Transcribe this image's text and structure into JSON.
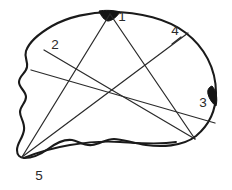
{
  "figure": {
    "type": "line-drawing",
    "background_color": "#ffffff",
    "outline_color": "#1a1a1a",
    "chord_color": "#2b2b2b",
    "label_color": "#2a2a2a",
    "accent_color": "#141414",
    "canvas": {
      "width": 232,
      "height": 190
    }
  },
  "labels": [
    {
      "id": "1",
      "text": "1",
      "x": 122,
      "y": 17
    },
    {
      "id": "2",
      "text": "2",
      "x": 55,
      "y": 45
    },
    {
      "id": "3",
      "text": "3",
      "x": 203,
      "y": 103
    },
    {
      "id": "4",
      "text": "4",
      "x": 175,
      "y": 31
    },
    {
      "id": "5",
      "text": "5",
      "x": 39,
      "y": 176
    }
  ],
  "landmark_points": [
    {
      "id": "1",
      "x": 110,
      "y": 13
    },
    {
      "id": "2",
      "x": 44,
      "y": 50
    },
    {
      "id": "3",
      "x": 215,
      "y": 97
    },
    {
      "id": "4",
      "x": 188,
      "y": 33
    },
    {
      "id": "5",
      "x": 22,
      "y": 157
    }
  ],
  "outline": {
    "cranium_path": "M 110 12 C 140 12 168 19 186 33 C 204 47 216 68 216 93 C 216 112 208 126 196 136 C 182 147 160 147 146 145 C 132 143 122 139 114 139 C 106 139 100 144 92 145 C 84 146 78 141 72 140 C 64 139 56 143 48 149 C 40 155 32 158 24 158 C 20 158 17 155 17 150 C 17 143 23 138 24 130 C 25 122 20 118 20 112 C 20 106 26 103 26 97 C 26 91 19 88 19 82 C 19 76 26 73 27 67 C 28 61 24 57 26 51 C 29 42 40 33 52 26 C 68 17 90 12 110 12 Z",
    "jaw_path": "M 24 158 C 36 153 52 148 70 145 C 88 142 106 141 120 142 C 138 143 158 145 176 142",
    "accent_top": "M 99 11 C 104 10 114 10 120 12 C 116 18 111 21 108 21 C 105 21 101 16 99 11 Z",
    "accent_right": "M 212 86 C 216 90 218 98 216 106 C 213 104 209 99 208 94 C 207 90 209 87 212 86 Z"
  },
  "chords": [
    {
      "name": "chord-1-5",
      "x1": 110,
      "y1": 14,
      "x2": 22,
      "y2": 157
    },
    {
      "name": "chord-1-3-lower-right",
      "x1": 110,
      "y1": 14,
      "x2": 195,
      "y2": 139
    },
    {
      "name": "chord-2-lower-right",
      "x1": 44,
      "y1": 50,
      "x2": 195,
      "y2": 139
    },
    {
      "name": "chord-left-edge-to-3",
      "x1": 31,
      "y1": 70,
      "x2": 215,
      "y2": 123
    },
    {
      "name": "chord-4-to-5",
      "x1": 188,
      "y1": 33,
      "x2": 22,
      "y2": 157
    }
  ],
  "label_leaders": [
    {
      "name": "leader-4",
      "x1": 181,
      "y1": 37,
      "x2": 172,
      "y2": 44
    }
  ]
}
